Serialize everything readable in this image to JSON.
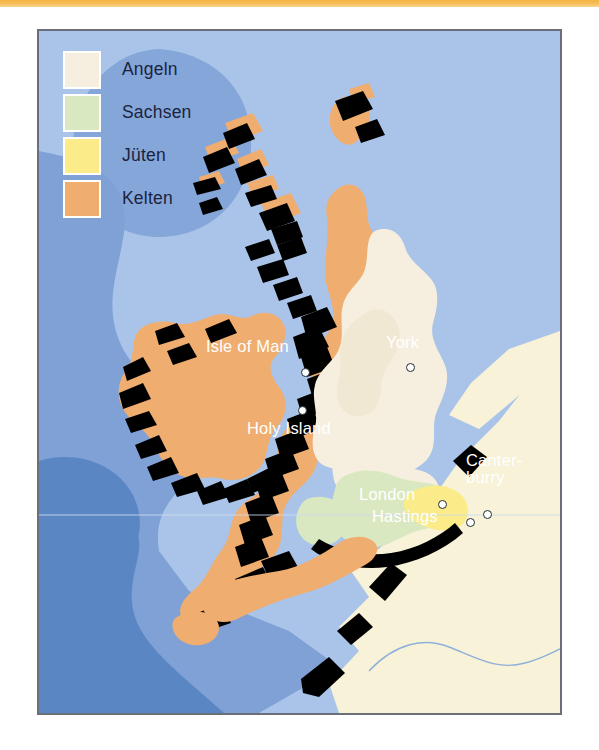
{
  "page": {
    "top_rule_color": "#f5b442",
    "background_color": "#ffffff"
  },
  "map": {
    "frame_border_color": "#6b6f77",
    "sea_colors": {
      "shallow": "#a9c4e8",
      "mid": "#7fa1d6",
      "deep": "#5b86c4"
    },
    "continent_color": "#f7f2d8",
    "coast_shadow_color": "#000000",
    "river_color": "#8fb0d8",
    "latitude_line_color": "#cddcef"
  },
  "legend": {
    "items": [
      {
        "label": "Angeln",
        "color": "#f6efdf",
        "swatch_icon": "legend-swatch-angeln"
      },
      {
        "label": "Sachsen",
        "color": "#d9e8c1",
        "swatch_icon": "legend-swatch-sachsen"
      },
      {
        "label": "Jüten",
        "color": "#fbeb89",
        "swatch_icon": "legend-swatch-jueten"
      },
      {
        "label": "Kelten",
        "color": "#f0ad70",
        "swatch_icon": "legend-swatch-kelten"
      }
    ]
  },
  "cities": [
    {
      "name": "Isle of Man",
      "label": "Isle of Man",
      "marker_x": 262,
      "marker_y": 337,
      "label_x": 167,
      "label_y": 307
    },
    {
      "name": "York",
      "label": "York",
      "marker_x": 367,
      "marker_y": 332,
      "label_x": 347,
      "label_y": 303
    },
    {
      "name": "Holy Island",
      "label": "Holy Island",
      "marker_x": 259,
      "marker_y": 375,
      "label_x": 208,
      "label_y": 389
    },
    {
      "name": "London",
      "label": "London",
      "marker_x": 399,
      "marker_y": 469,
      "label_x": 320,
      "label_y": 455
    },
    {
      "name": "Hastings",
      "label": "Hastings",
      "marker_x": 427,
      "marker_y": 487,
      "label_x": 333,
      "label_y": 477
    },
    {
      "name": "Canterburry",
      "label": "Canter-\nburry",
      "marker_x": 444,
      "marker_y": 479,
      "label_x": 427,
      "label_y": 421
    }
  ]
}
